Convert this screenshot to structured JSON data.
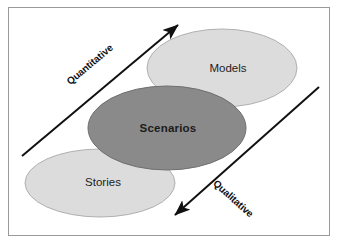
{
  "diagram": {
    "frame": {
      "border_color": "#9a9a9a",
      "background_color": "#ffffff"
    },
    "ellipses": [
      {
        "id": "models",
        "label": "Models",
        "fill": "#dcdcdc",
        "stroke": "#b0b0b0",
        "text_weight": "regular",
        "cx": 222,
        "cy": 68,
        "rx": 75,
        "ry": 39
      },
      {
        "id": "scenarios",
        "label": "Scenarios",
        "fill": "#8a8a8a",
        "stroke": "#6f6f6f",
        "text_weight": "bold",
        "cx": 167,
        "cy": 128,
        "rx": 79,
        "ry": 42
      },
      {
        "id": "stories",
        "label": "Stories",
        "fill": "#dcdcdc",
        "stroke": "#b0b0b0",
        "text_weight": "regular",
        "cx": 100,
        "cy": 183,
        "rx": 75,
        "ry": 34
      }
    ],
    "arrows": [
      {
        "id": "quantitative",
        "label": "Quantitative",
        "color": "#111111",
        "x1": 22,
        "y1": 156,
        "x2": 181,
        "y2": 22,
        "label_x": 92,
        "label_y": 67,
        "label_rotation": -40
      },
      {
        "id": "qualitative",
        "label": "Qualitative",
        "color": "#111111",
        "x1": 319,
        "y1": 87,
        "x2": 172,
        "y2": 218,
        "label_x": 230,
        "label_y": 200,
        "label_rotation": 42
      }
    ]
  }
}
